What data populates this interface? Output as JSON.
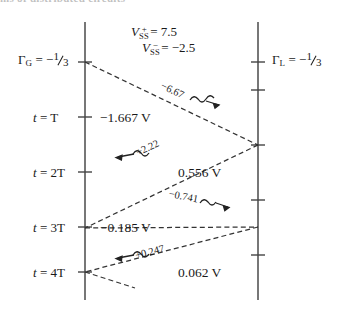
{
  "figure": {
    "type": "bounce-diagram",
    "topstrip_text": "ms of distributed circuits",
    "source_reflection": {
      "symbol": "Γ",
      "subscript": "G",
      "sign": "−",
      "numerator": "1",
      "denominator": "3"
    },
    "load_reflection": {
      "symbol": "Γ",
      "subscript": "L",
      "sign": "−",
      "numerator": "1",
      "denominator": "3"
    },
    "steady_state": {
      "positive": {
        "symbol": "V",
        "sub": "SS",
        "sup": "+",
        "eq": "=",
        "value": "7.5"
      },
      "negative": {
        "symbol": "V",
        "sub": "SS",
        "sup": "−",
        "eq": "=",
        "value": "−2.5"
      }
    },
    "time_labels": [
      {
        "t": "t",
        "eq": "=",
        "value": "T"
      },
      {
        "t": "t",
        "eq": "=",
        "value": "2T"
      },
      {
        "t": "t",
        "eq": "=",
        "value": "3T"
      },
      {
        "t": "t",
        "eq": "=",
        "value": "4T"
      }
    ],
    "voltage_values": [
      {
        "text": "−1.667 V",
        "at": "t = T"
      },
      {
        "text": "0.556 V",
        "at": "t = 2T"
      },
      {
        "text": "−0.185 V",
        "at": "t = 3T"
      },
      {
        "text": "0.062 V",
        "at": "t = 4T"
      }
    ],
    "wave_labels": [
      {
        "text": "−6.67",
        "direction": "right"
      },
      {
        "text": "+2.22",
        "direction": "left"
      },
      {
        "text": "−0.741",
        "direction": "right"
      },
      {
        "text": "+0.247",
        "direction": "left"
      }
    ],
    "colors": {
      "ink": "#1a1a1a",
      "line": "#555555",
      "background": "#ffffff"
    }
  }
}
